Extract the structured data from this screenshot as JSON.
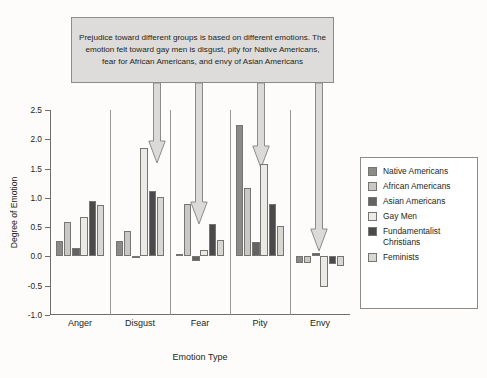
{
  "callout": {
    "text": "Prejudice toward different groups is based on different emotions. The emotion felt toward gay men is disgust, pity for Native Americans, fear for African Americans, and envy of Asian Americans"
  },
  "axis": {
    "ylabel": "Degree of Emotion",
    "xlabel": "Emotion Type",
    "yticks": [
      "2.5",
      "2.0",
      "1.5",
      "1.0",
      "0.5",
      "0.0",
      "-0.5",
      "-1.0"
    ]
  },
  "legend": {
    "items": [
      {
        "label": "Native Americans",
        "color": "#8a8a8a"
      },
      {
        "label": "African Americans",
        "color": "#c8c8c6"
      },
      {
        "label": "Asian Americans",
        "color": "#636363"
      },
      {
        "label": "Gay Men",
        "color": "#eceae6"
      },
      {
        "label": "Fundamentalist Christians",
        "color": "#4a4a4a"
      },
      {
        "label": "Feminists",
        "color": "#d9d7d3"
      }
    ]
  },
  "annotations": {
    "arrows": [
      {
        "name": "arrow-disgust-gay-men"
      },
      {
        "name": "arrow-fear-african-americans"
      },
      {
        "name": "arrow-pity-gay-men"
      },
      {
        "name": "arrow-envy-gay-men"
      }
    ]
  },
  "chart_data": {
    "type": "bar",
    "title": "",
    "xlabel": "Emotion Type",
    "ylabel": "Degree of Emotion",
    "ylim": [
      -1.0,
      2.5
    ],
    "ytick_step": 0.5,
    "grid": false,
    "legend_position": "right",
    "categories": [
      "Anger",
      "Disgust",
      "Fear",
      "Pity",
      "Envy"
    ],
    "series": [
      {
        "name": "Native Americans",
        "color": "#8a8a8a",
        "values": [
          0.26,
          0.26,
          0.04,
          2.24,
          -0.11
        ]
      },
      {
        "name": "African Americans",
        "color": "#c8c8c6",
        "values": [
          0.58,
          0.44,
          0.9,
          1.17,
          -0.11
        ]
      },
      {
        "name": "Asian Americans",
        "color": "#636363",
        "values": [
          0.14,
          0.0,
          -0.08,
          0.24,
          0.06
        ]
      },
      {
        "name": "Gay Men",
        "color": "#eceae6",
        "values": [
          0.67,
          1.85,
          0.11,
          1.58,
          -0.53
        ]
      },
      {
        "name": "Fundamentalist Christians",
        "color": "#4a4a4a",
        "values": [
          0.94,
          1.12,
          0.56,
          0.89,
          -0.13
        ]
      },
      {
        "name": "Feminists",
        "color": "#d9d7d3",
        "values": [
          0.87,
          1.02,
          0.28,
          0.52,
          -0.17
        ]
      }
    ]
  }
}
